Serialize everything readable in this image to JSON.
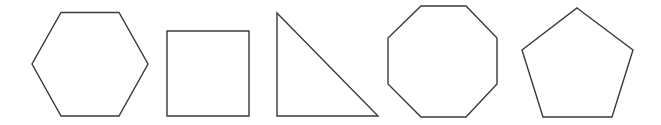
{
  "diagram": {
    "title": "",
    "stroke_color": "#3a3a3a",
    "fill_color": "#ffffff",
    "shapes": [
      {
        "name": "hexagon",
        "sides": 6
      },
      {
        "name": "square",
        "sides": 4
      },
      {
        "name": "right-triangle",
        "sides": 3
      },
      {
        "name": "octagon",
        "sides": 8
      },
      {
        "name": "pentagon",
        "sides": 5
      }
    ]
  }
}
